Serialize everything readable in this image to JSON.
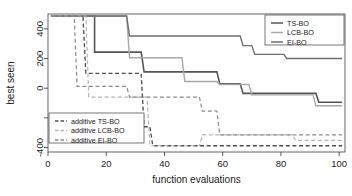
{
  "chart_data": {
    "type": "line",
    "title": "",
    "xlabel": "function evaluations",
    "ylabel": "best seen",
    "xlim": [
      0,
      102
    ],
    "ylim": [
      -430,
      500
    ],
    "xticks": [
      0,
      20,
      40,
      60,
      80,
      100
    ],
    "xtick_labels": [
      "0",
      "20",
      "40",
      "60",
      "80",
      "100"
    ],
    "yticks": [
      400,
      200,
      0,
      -200,
      -400
    ],
    "ytick_labels": [
      "400",
      "200",
      "0",
      "",
      "-400"
    ],
    "grid": false,
    "step_type": "post",
    "legend_positions": [
      "top-right",
      "bottom-left"
    ],
    "series": [
      {
        "name": "TS-BO",
        "style": "solid",
        "color": "#555555",
        "width": 1.6,
        "legend": "top-right",
        "points": [
          [
            1,
            487
          ],
          [
            16,
            487
          ],
          [
            16,
            243
          ],
          [
            32,
            243
          ],
          [
            33,
            110
          ],
          [
            58,
            110
          ],
          [
            59,
            30
          ],
          [
            66,
            30
          ],
          [
            67,
            -35
          ],
          [
            70,
            -35
          ],
          [
            92,
            -35
          ],
          [
            93,
            -95
          ],
          [
            101,
            -95
          ]
        ]
      },
      {
        "name": "LCB-BO",
        "style": "solid",
        "color": "#a8a8a8",
        "width": 1.4,
        "legend": "top-right",
        "points": [
          [
            1,
            487
          ],
          [
            27,
            487
          ],
          [
            28,
            205
          ],
          [
            46,
            205
          ],
          [
            47,
            45
          ],
          [
            58,
            45
          ],
          [
            59,
            25
          ],
          [
            69,
            25
          ],
          [
            70,
            -45
          ],
          [
            91,
            -45
          ],
          [
            92,
            -118
          ],
          [
            101,
            -118
          ]
        ]
      },
      {
        "name": "EI-BO",
        "style": "solid",
        "color": "#6e6e6e",
        "width": 1.4,
        "legend": "top-right",
        "points": [
          [
            1,
            487
          ],
          [
            27,
            487
          ],
          [
            28,
            352
          ],
          [
            66,
            352
          ],
          [
            67,
            287
          ],
          [
            70,
            287
          ],
          [
            71,
            228
          ],
          [
            81,
            228
          ],
          [
            82,
            200
          ],
          [
            101,
            200
          ]
        ]
      },
      {
        "name": "additive TS-BO",
        "style": "dashed",
        "color": "#4d4d4d",
        "width": 1.3,
        "legend": "bottom-left",
        "points": [
          [
            1,
            487
          ],
          [
            12,
            487
          ],
          [
            13,
            100
          ],
          [
            32,
            100
          ],
          [
            33,
            -260
          ],
          [
            35,
            -260
          ],
          [
            36,
            -388
          ],
          [
            101,
            -388
          ]
        ]
      },
      {
        "name": "additive LCB-BO",
        "style": "dashed",
        "color": "#b5b5b5",
        "width": 1.2,
        "legend": "bottom-left",
        "points": [
          [
            1,
            487
          ],
          [
            13,
            487
          ],
          [
            14,
            -60
          ],
          [
            34,
            -60
          ],
          [
            35,
            -388
          ],
          [
            52,
            -388
          ],
          [
            53,
            -315
          ],
          [
            84,
            -315
          ],
          [
            85,
            -352
          ],
          [
            101,
            -352
          ]
        ]
      },
      {
        "name": "additive EI-BO",
        "style": "dashed",
        "color": "#8c8c8c",
        "width": 1.2,
        "legend": "bottom-left",
        "points": [
          [
            1,
            487
          ],
          [
            9,
            487
          ],
          [
            10,
            12
          ],
          [
            27,
            12
          ],
          [
            28,
            -60
          ],
          [
            36,
            -60
          ],
          [
            37,
            -60
          ],
          [
            52,
            -60
          ],
          [
            53,
            -155
          ],
          [
            58,
            -155
          ],
          [
            59,
            -315
          ],
          [
            101,
            -315
          ]
        ]
      }
    ]
  },
  "legend_top": {
    "items": [
      {
        "label": "TS-BO",
        "series": "TS-BO"
      },
      {
        "label": "LCB-BO",
        "series": "LCB-BO"
      },
      {
        "label": "EI-BO",
        "series": "EI-BO"
      }
    ]
  },
  "legend_bottom": {
    "items": [
      {
        "label": "additive TS-BO",
        "series": "additive TS-BO"
      },
      {
        "label": "additive LCB-BO",
        "series": "additive LCB-BO"
      },
      {
        "label": "additive EI-BO",
        "series": "additive EI-BO"
      }
    ]
  },
  "axes": {
    "x_title": "function evaluations",
    "y_title": "best seen"
  }
}
